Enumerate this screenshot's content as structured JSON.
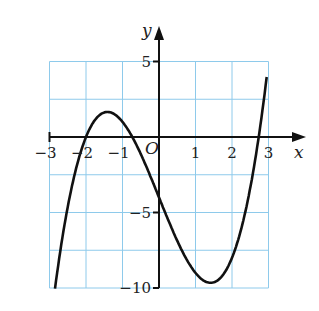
{
  "chart_data": {
    "type": "line",
    "title": "",
    "xlabel": "x",
    "ylabel": "y",
    "origin_label": "O",
    "xlim": [
      -3,
      3
    ],
    "ylim": [
      -10,
      5
    ],
    "grid": true,
    "grid_color": "#8ecaeb",
    "curve_color": "#111111",
    "x_ticks": [
      "-3",
      "-2",
      "-1",
      "1",
      "2",
      "3"
    ],
    "y_ticks": [
      "5",
      "-5",
      "-10"
    ],
    "function": "y = x^3 - 6x - 4",
    "series": [
      {
        "name": "curve",
        "x": [
          -2.85,
          -2.5,
          -2.0,
          -1.5,
          -1.414,
          -1.0,
          -0.73,
          -0.5,
          0.0,
          0.5,
          1.0,
          1.414,
          1.5,
          2.0,
          2.5,
          2.73,
          2.95
        ],
        "values": [
          -10.05,
          -4.6,
          0.0,
          1.6,
          1.66,
          1.0,
          0.0,
          -1.1,
          -4.0,
          -6.9,
          -9.0,
          -9.66,
          -9.6,
          -8.0,
          -3.4,
          0.0,
          4.0
        ]
      }
    ]
  }
}
